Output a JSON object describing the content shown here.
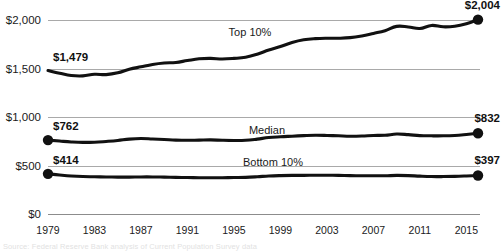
{
  "chart_data": {
    "type": "line",
    "title": "",
    "subtitle": "",
    "xlabel": "",
    "ylabel": "",
    "grid": true,
    "legend_position": "inline-labels",
    "xlim": [
      1979,
      2016
    ],
    "ylim": [
      0,
      2150
    ],
    "x_ticks": [
      "1979",
      "1983",
      "1987",
      "1991",
      "1995",
      "1999",
      "2003",
      "2007",
      "2011",
      "2015"
    ],
    "x_tick_values": [
      1979,
      1983,
      1987,
      1991,
      1995,
      1999,
      2003,
      2007,
      2011,
      2015
    ],
    "y_ticks": [
      "$0",
      "$500",
      "$1,000",
      "$1,500",
      "$2,000"
    ],
    "y_tick_values": [
      0,
      500,
      1000,
      1500,
      2000
    ],
    "x": [
      1979,
      1980,
      1981,
      1982,
      1983,
      1984,
      1985,
      1986,
      1987,
      1988,
      1989,
      1990,
      1991,
      1992,
      1993,
      1994,
      1995,
      1996,
      1997,
      1998,
      1999,
      2000,
      2001,
      2002,
      2003,
      2004,
      2005,
      2006,
      2007,
      2008,
      2009,
      2010,
      2011,
      2012,
      2013,
      2014,
      2015,
      2016
    ],
    "series": [
      {
        "name": "Top 10%",
        "label": "Top 10%",
        "start_value_label": "$1,479",
        "end_value_label": "$2,004",
        "start_value": 1479,
        "end_value": 2004,
        "values": [
          1479,
          1452,
          1428,
          1424,
          1440,
          1437,
          1455,
          1492,
          1517,
          1541,
          1556,
          1562,
          1582,
          1600,
          1604,
          1598,
          1604,
          1616,
          1647,
          1690,
          1726,
          1768,
          1796,
          1808,
          1812,
          1812,
          1818,
          1836,
          1862,
          1890,
          1934,
          1928,
          1912,
          1944,
          1930,
          1936,
          1962,
          2004
        ]
      },
      {
        "name": "Median",
        "label": "Median",
        "start_value_label": "$762",
        "end_value_label": "$832",
        "start_value": 762,
        "end_value": 832,
        "values": [
          762,
          752,
          743,
          738,
          740,
          748,
          758,
          772,
          778,
          773,
          768,
          762,
          760,
          762,
          764,
          760,
          758,
          760,
          772,
          788,
          796,
          802,
          808,
          812,
          810,
          806,
          802,
          804,
          810,
          812,
          824,
          818,
          808,
          806,
          806,
          810,
          820,
          832
        ]
      },
      {
        "name": "Bottom 10%",
        "label": "Bottom 10%",
        "start_value_label": "$414",
        "end_value_label": "$397",
        "start_value": 414,
        "end_value": 397,
        "values": [
          414,
          402,
          392,
          386,
          384,
          382,
          380,
          380,
          382,
          382,
          380,
          378,
          376,
          374,
          374,
          374,
          376,
          378,
          384,
          392,
          396,
          398,
          398,
          400,
          400,
          398,
          396,
          394,
          394,
          394,
          398,
          396,
          390,
          386,
          386,
          388,
          392,
          397
        ]
      }
    ]
  },
  "source": {
    "note": "Source: Federal Reserve Bank analysis of Current Population Survey data"
  }
}
